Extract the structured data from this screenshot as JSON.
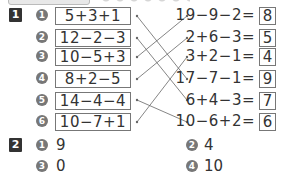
{
  "section1": {
    "badge": "1",
    "left": [
      {
        "num": "1",
        "expr": "5+3+1"
      },
      {
        "num": "2",
        "expr": "12−2−3"
      },
      {
        "num": "3",
        "expr": "10−5+3"
      },
      {
        "num": "4",
        "expr": "8+2−5"
      },
      {
        "num": "5",
        "expr": "14−4−4"
      },
      {
        "num": "6",
        "expr": "10−7+1"
      }
    ],
    "right": [
      {
        "expr": "19−9−2=",
        "answer": "8"
      },
      {
        "expr": "2+6−3=",
        "answer": "5"
      },
      {
        "expr": "3+2−1=",
        "answer": "4"
      },
      {
        "expr": "17−7−1=",
        "answer": "9"
      },
      {
        "expr": "6+4−3=",
        "answer": "7"
      },
      {
        "expr": "10−6+2=",
        "answer": "6"
      }
    ],
    "connections": [
      [
        1,
        4
      ],
      [
        2,
        5
      ],
      [
        3,
        1
      ],
      [
        4,
        2
      ],
      [
        5,
        6
      ],
      [
        6,
        3
      ]
    ]
  },
  "section2": {
    "badge": "2",
    "answers": [
      {
        "num": "1",
        "value": "9"
      },
      {
        "num": "2",
        "value": "4"
      },
      {
        "num": "3",
        "value": "0"
      },
      {
        "num": "4",
        "value": "10"
      }
    ]
  },
  "colors": {
    "badge": "#333333",
    "circle": "#777777",
    "line": "#666666",
    "box_border": "#777777"
  }
}
